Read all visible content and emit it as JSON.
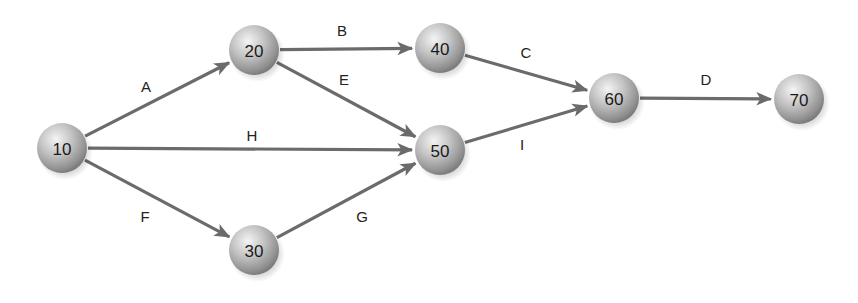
{
  "diagram": {
    "type": "activity-on-arrow network",
    "nodes": [
      {
        "id": "10",
        "label": "10",
        "x": 62,
        "y": 148
      },
      {
        "id": "20",
        "label": "20",
        "x": 254,
        "y": 50
      },
      {
        "id": "30",
        "label": "30",
        "x": 254,
        "y": 250
      },
      {
        "id": "40",
        "label": "40",
        "x": 440,
        "y": 48
      },
      {
        "id": "50",
        "label": "50",
        "x": 440,
        "y": 150
      },
      {
        "id": "60",
        "label": "60",
        "x": 614,
        "y": 98
      },
      {
        "id": "70",
        "label": "70",
        "x": 799,
        "y": 99
      }
    ],
    "edges": [
      {
        "label": "A",
        "from": "10",
        "to": "20",
        "lx": 146,
        "ly": 92
      },
      {
        "label": "B",
        "from": "20",
        "to": "40",
        "lx": 342,
        "ly": 36
      },
      {
        "label": "E",
        "from": "20",
        "to": "50",
        "lx": 344,
        "ly": 85
      },
      {
        "label": "H",
        "from": "10",
        "to": "50",
        "lx": 252,
        "ly": 141
      },
      {
        "label": "F",
        "from": "10",
        "to": "30",
        "lx": 145,
        "ly": 222
      },
      {
        "label": "G",
        "from": "30",
        "to": "50",
        "lx": 362,
        "ly": 222
      },
      {
        "label": "C",
        "from": "40",
        "to": "60",
        "lx": 526,
        "ly": 58
      },
      {
        "label": "I",
        "from": "50",
        "to": "60",
        "lx": 522,
        "ly": 150
      },
      {
        "label": "D",
        "from": "60",
        "to": "70",
        "lx": 706,
        "ly": 85
      }
    ],
    "node_radius": 25,
    "colors": {
      "edge": "#6b6b6b",
      "node_highlight": "#f2f2f2",
      "node_mid": "#b8b8b8",
      "node_edge": "#7e7e7e",
      "text": "#1a1a1a"
    }
  }
}
